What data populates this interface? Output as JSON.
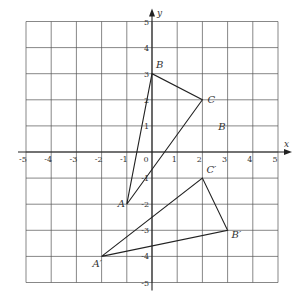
{
  "diagram": {
    "title": "",
    "type": "coordinate-grid-transformation",
    "grid": {
      "x_min": -5,
      "x_max": 5,
      "y_min": -5,
      "y_max": 5,
      "origin_px": [
        152,
        152
      ],
      "step_x_px": 25.2,
      "step_y_px": 26.1,
      "line_color": "#555555",
      "axis_color": "#222222"
    },
    "axes": {
      "x_label": "x",
      "y_label": "y",
      "x_ticks": [
        "-5",
        "-4",
        "-3",
        "-2",
        "-1",
        "0",
        "1",
        "2",
        "3",
        "4",
        "5"
      ],
      "y_ticks": [
        "5",
        "4",
        "3",
        "2",
        "1",
        "-1",
        "-2",
        "-3",
        "-4",
        "-5"
      ]
    },
    "triangles": [
      {
        "name": "ABC",
        "vertices": [
          {
            "label": "A",
            "x": -1,
            "y": -2
          },
          {
            "label": "B",
            "x": 0,
            "y": 3
          },
          {
            "label": "C",
            "x": 2,
            "y": 2
          }
        ]
      },
      {
        "name": "A'B'C'",
        "vertices": [
          {
            "label": "A′",
            "x": -2,
            "y": -4
          },
          {
            "label": "B′",
            "x": 3,
            "y": -3
          },
          {
            "label": "C′",
            "x": 2,
            "y": -1
          }
        ]
      }
    ],
    "annotations": [
      {
        "label": "B",
        "x": 2.75,
        "y": 1
      }
    ]
  }
}
